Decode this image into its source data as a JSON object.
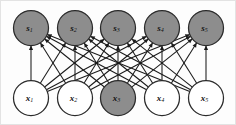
{
  "figure": {
    "type": "diagram",
    "width": 236,
    "height": 125,
    "background_color": "#fdfdfd",
    "frame_color": "#e3e3e3"
  },
  "style": {
    "shaded_fill": "#8d8d8d",
    "open_fill": "#ffffff",
    "node_stroke": "#2b2b2b",
    "edge_color": "#1a1a1a",
    "node_radius": 17.5,
    "edge_width": 1.05
  },
  "layers": {
    "top": {
      "name": "source-layer",
      "center_y": 28,
      "nodes": [
        {
          "id": "s1",
          "label": "s",
          "subscript": "1",
          "cx": 31,
          "cy": 28,
          "shaded": true
        },
        {
          "id": "s2",
          "label": "s",
          "subscript": "2",
          "cx": 75,
          "cy": 28,
          "shaded": true
        },
        {
          "id": "s3",
          "label": "s",
          "subscript": "3",
          "cx": 118,
          "cy": 28,
          "shaded": true
        },
        {
          "id": "s4",
          "label": "s",
          "subscript": "4",
          "cx": 162,
          "cy": 28,
          "shaded": true
        },
        {
          "id": "s5",
          "label": "s",
          "subscript": "5",
          "cx": 206,
          "cy": 28,
          "shaded": true
        }
      ]
    },
    "bottom": {
      "name": "observation-layer",
      "center_y": 98,
      "nodes": [
        {
          "id": "x1",
          "label": "x",
          "subscript": "1",
          "cx": 31,
          "cy": 98,
          "shaded": false
        },
        {
          "id": "x2",
          "label": "x",
          "subscript": "2",
          "cx": 75,
          "cy": 98,
          "shaded": false
        },
        {
          "id": "x3",
          "label": "x",
          "subscript": "3",
          "cx": 118,
          "cy": 98,
          "shaded": true
        },
        {
          "id": "x4",
          "label": "x",
          "subscript": "4",
          "cx": 162,
          "cy": 98,
          "shaded": false
        },
        {
          "id": "x5",
          "label": "x",
          "subscript": "5",
          "cx": 206,
          "cy": 98,
          "shaded": false
        }
      ]
    }
  },
  "edges": {
    "description": "Every bottom node connects to every top node with an upward-pointing arrow (complete bipartite, 25 directed edges).",
    "direction": "bottom-to-top",
    "arrowhead": true,
    "pairs": [
      [
        "x1",
        "s1"
      ],
      [
        "x1",
        "s2"
      ],
      [
        "x1",
        "s3"
      ],
      [
        "x1",
        "s4"
      ],
      [
        "x1",
        "s5"
      ],
      [
        "x2",
        "s1"
      ],
      [
        "x2",
        "s2"
      ],
      [
        "x2",
        "s3"
      ],
      [
        "x2",
        "s4"
      ],
      [
        "x2",
        "s5"
      ],
      [
        "x3",
        "s1"
      ],
      [
        "x3",
        "s2"
      ],
      [
        "x3",
        "s3"
      ],
      [
        "x3",
        "s4"
      ],
      [
        "x3",
        "s5"
      ],
      [
        "x4",
        "s1"
      ],
      [
        "x4",
        "s2"
      ],
      [
        "x4",
        "s3"
      ],
      [
        "x4",
        "s4"
      ],
      [
        "x4",
        "s5"
      ],
      [
        "x5",
        "s1"
      ],
      [
        "x5",
        "s2"
      ],
      [
        "x5",
        "s3"
      ],
      [
        "x5",
        "s4"
      ],
      [
        "x5",
        "s5"
      ]
    ]
  }
}
